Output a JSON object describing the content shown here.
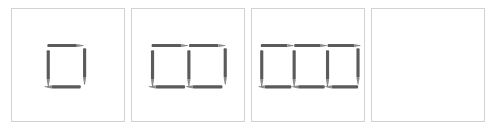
{
  "figure": {
    "type": "matchstick-sequence-puzzle",
    "background_color": "#ffffff",
    "panel_border_color": "#d2d2d2",
    "pencil_color": "#5b5b5b",
    "pencil_tip_color": "#3a3a3a",
    "panel_count": 4,
    "panels": [
      {
        "index": 1,
        "name": "panel-1",
        "squares": 1,
        "pencil_count": 4,
        "empty": false,
        "description": "one square formed by 4 pencils",
        "pencils": [
          {
            "id": "p1-top-1",
            "orientation": "horizontal",
            "tip": "right",
            "x": 36,
            "y": 36,
            "length": 36
          },
          {
            "id": "p1-left-1",
            "orientation": "vertical",
            "tip": "down",
            "x": 36,
            "y": 39,
            "length": 38
          },
          {
            "id": "p1-right-1",
            "orientation": "vertical",
            "tip": "down",
            "x": 72,
            "y": 39,
            "length": 38
          },
          {
            "id": "p1-bottom-1",
            "orientation": "horizontal",
            "tip": "left",
            "x": 36,
            "y": 77,
            "length": 36
          }
        ]
      },
      {
        "index": 2,
        "name": "panel-2",
        "squares": 2,
        "pencil_count": 7,
        "empty": false,
        "description": "two adjacent squares formed by 7 pencils",
        "pencils": [
          {
            "id": "p2-top-1",
            "orientation": "horizontal",
            "tip": "right",
            "x": 19,
            "y": 36,
            "length": 36
          },
          {
            "id": "p2-top-2",
            "orientation": "horizontal",
            "tip": "right",
            "x": 57,
            "y": 36,
            "length": 36
          },
          {
            "id": "p2-left-1",
            "orientation": "vertical",
            "tip": "down",
            "x": 19,
            "y": 39,
            "length": 38
          },
          {
            "id": "p2-mid-1",
            "orientation": "vertical",
            "tip": "down",
            "x": 57,
            "y": 39,
            "length": 38
          },
          {
            "id": "p2-right-1",
            "orientation": "vertical",
            "tip": "down",
            "x": 93,
            "y": 39,
            "length": 38
          },
          {
            "id": "p2-bottom-1",
            "orientation": "horizontal",
            "tip": "left",
            "x": 19,
            "y": 77,
            "length": 36
          },
          {
            "id": "p2-bottom-2",
            "orientation": "horizontal",
            "tip": "left",
            "x": 57,
            "y": 77,
            "length": 36
          }
        ]
      },
      {
        "index": 3,
        "name": "panel-3",
        "squares": 3,
        "pencil_count": 10,
        "empty": false,
        "description": "three adjacent squares formed by 10 pencils",
        "pencils": [
          {
            "id": "p3-top-1",
            "orientation": "horizontal",
            "tip": "right",
            "x": 8,
            "y": 36,
            "length": 33
          },
          {
            "id": "p3-top-2",
            "orientation": "horizontal",
            "tip": "right",
            "x": 42,
            "y": 36,
            "length": 33
          },
          {
            "id": "p3-top-3",
            "orientation": "horizontal",
            "tip": "right",
            "x": 76,
            "y": 36,
            "length": 33
          },
          {
            "id": "p3-left-1",
            "orientation": "vertical",
            "tip": "down",
            "x": 8,
            "y": 39,
            "length": 38
          },
          {
            "id": "p3-mid-1",
            "orientation": "vertical",
            "tip": "down",
            "x": 42,
            "y": 39,
            "length": 38
          },
          {
            "id": "p3-mid-2",
            "orientation": "vertical",
            "tip": "down",
            "x": 76,
            "y": 39,
            "length": 38
          },
          {
            "id": "p3-right-1",
            "orientation": "vertical",
            "tip": "down",
            "x": 107,
            "y": 39,
            "length": 38
          },
          {
            "id": "p3-bottom-1",
            "orientation": "horizontal",
            "tip": "left",
            "x": 8,
            "y": 77,
            "length": 33
          },
          {
            "id": "p3-bottom-2",
            "orientation": "horizontal",
            "tip": "left",
            "x": 42,
            "y": 77,
            "length": 33
          },
          {
            "id": "p3-bottom-3",
            "orientation": "horizontal",
            "tip": "left",
            "x": 76,
            "y": 77,
            "length": 33
          }
        ]
      },
      {
        "index": 4,
        "name": "panel-4",
        "squares": 0,
        "pencil_count": 0,
        "empty": true,
        "description": "empty answer panel",
        "pencils": []
      }
    ]
  }
}
